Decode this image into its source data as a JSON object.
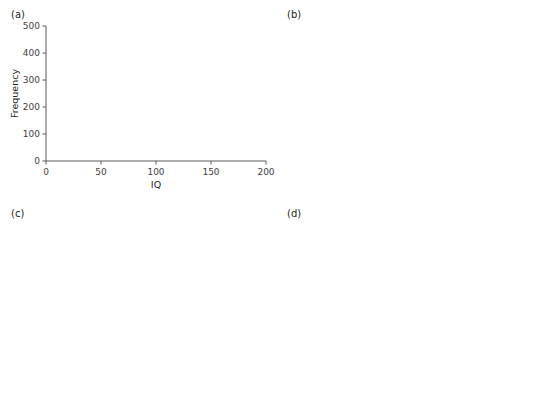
{
  "figure": {
    "panels": [
      "(a)",
      "(b)",
      "(c)",
      "(d)"
    ]
  },
  "colors": {
    "left_handed": "#9a9a9a",
    "right_handed": "#cfcfcf",
    "overlap": "#b4b4b4",
    "pvalue_bar": "#c4c4c4",
    "bar_stroke": "#7a7a7a",
    "axis": "#5a5a5a",
    "text": "#231f20",
    "threshold_line": "#231f20"
  },
  "legend": {
    "items": [
      {
        "label": "Left-handed",
        "swatch": "left_handed"
      },
      {
        "label": "Right-handed",
        "swatch": "right_handed"
      }
    ]
  },
  "panel_a": {
    "label": "(a)",
    "annotations": [
      "n = 1000",
      "left mean = 104",
      "right mean = 96",
      "sd = 15"
    ],
    "chart_data": {
      "type": "bar",
      "title": "",
      "xlabel": "IQ",
      "ylabel": "Frequency",
      "xlim": [
        0,
        200
      ],
      "ylim": [
        0,
        500
      ],
      "xticks": [
        0,
        50,
        100,
        150,
        200
      ],
      "yticks": [
        0,
        100,
        200,
        300,
        400,
        500
      ],
      "grid": false,
      "legend_position": "upper-left",
      "bin_width": 10,
      "bin_starts": [
        50,
        60,
        70,
        80,
        90,
        100,
        110,
        120,
        130,
        140
      ],
      "series": [
        {
          "name": "Right-handed",
          "values": [
            8,
            30,
            123,
            207,
            266,
            212,
            110,
            33,
            8,
            2
          ]
        },
        {
          "name": "Left-handed",
          "values": [
            2,
            6,
            45,
            130,
            211,
            268,
            223,
            90,
            33,
            10
          ]
        }
      ]
    }
  },
  "panel_b": {
    "label": "(b)",
    "power_text": "Power: 0.51",
    "threshold_label": "0.05",
    "chart_data": {
      "type": "bar",
      "title": "",
      "xlabel": "p-value",
      "ylabel": "Frequency",
      "xlim": [
        0,
        1.0
      ],
      "ylim": [
        0,
        1000
      ],
      "xticks": [
        0.0,
        0.2,
        0.4,
        0.6,
        0.8,
        1.0
      ],
      "yticks": [
        0,
        200,
        400,
        600,
        800,
        1000
      ],
      "grid": false,
      "threshold": 0.05,
      "bin_width": 0.05,
      "bin_starts": [
        0.0,
        0.05,
        0.1,
        0.15,
        0.2,
        0.25,
        0.3,
        0.35,
        0.4,
        0.45,
        0.5,
        0.55,
        0.6,
        0.65,
        0.7,
        0.75,
        0.8,
        0.85,
        0.9,
        0.95
      ],
      "values": [
        510,
        130,
        85,
        50,
        22,
        35,
        36,
        24,
        30,
        30,
        14,
        13,
        12,
        6,
        7,
        6,
        8,
        16,
        9,
        5
      ]
    }
  },
  "panel_c": {
    "label": "(c)",
    "annotations": [
      "n = 1000",
      "left mean = 108",
      "right mean = 93",
      "sd = 15"
    ],
    "chart_data": {
      "type": "bar",
      "title": "",
      "xlabel": "IQ",
      "ylabel": "Frequency",
      "xlim": [
        0,
        200
      ],
      "ylim": [
        0,
        500
      ],
      "xticks": [
        0,
        50,
        100,
        150,
        200
      ],
      "yticks": [
        0,
        100,
        200,
        300,
        400,
        500
      ],
      "grid": false,
      "legend_position": "upper-left",
      "bin_width": 10,
      "bin_starts": [
        50,
        60,
        70,
        80,
        90,
        100,
        110,
        120,
        130,
        140
      ],
      "series": [
        {
          "name": "Right-handed",
          "values": [
            16,
            34,
            118,
            237,
            249,
            182,
            112,
            28,
            5,
            2
          ]
        },
        {
          "name": "Left-handed",
          "values": [
            2,
            4,
            22,
            85,
            166,
            234,
            269,
            138,
            50,
            16
          ]
        }
      ]
    }
  },
  "panel_d": {
    "label": "(d)",
    "power_text": "Power: 0.9",
    "threshold_label": "0.05",
    "chart_data": {
      "type": "bar",
      "title": "",
      "xlabel": "p-value",
      "ylabel": "Frequency",
      "xlim": [
        0,
        1.0
      ],
      "ylim": [
        0,
        1000
      ],
      "xticks": [
        0.0,
        0.2,
        0.4,
        0.6,
        0.8,
        1.0
      ],
      "yticks": [
        0,
        200,
        400,
        600,
        800,
        1000
      ],
      "grid": false,
      "threshold": 0.05,
      "bin_width": 0.05,
      "bin_starts": [
        0.0,
        0.05,
        0.1,
        0.15,
        0.2,
        0.25,
        0.3,
        0.35,
        0.4,
        0.45,
        0.5,
        0.55,
        0.6,
        0.65,
        0.7,
        0.75,
        0.8,
        0.85,
        0.9,
        0.95
      ],
      "values": [
        900,
        55,
        26,
        8,
        4,
        2,
        2,
        1,
        1,
        1,
        0,
        0,
        0,
        0,
        0,
        0,
        0,
        0,
        0,
        0
      ]
    }
  }
}
